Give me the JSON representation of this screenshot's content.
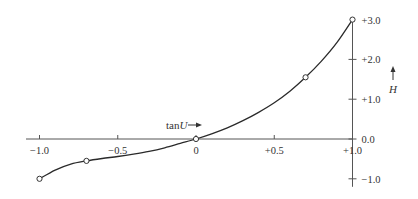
{
  "chart_data": {
    "type": "line",
    "title": "",
    "xlabel": "tanU",
    "ylabel": "H",
    "xlim": [
      -1.0,
      1.0
    ],
    "ylim": [
      -1.0,
      3.0
    ],
    "grid": false,
    "legend": null,
    "x_ticks": [
      -1.0,
      -0.5,
      0,
      0.5,
      1.0
    ],
    "x_tick_labels": [
      "-1.0",
      "-0.5",
      "0",
      "+0.5",
      "+1.0"
    ],
    "y_ticks": [
      -1.0,
      0.0,
      1.0,
      2.0,
      3.0
    ],
    "y_tick_labels": [
      "-1.0",
      "0.0",
      "+1.0",
      "+2.0",
      "+3.0"
    ],
    "series": [
      {
        "name": "H",
        "marker": "open-circle",
        "x": [
          -1.0,
          -0.7,
          0.0,
          0.7,
          1.0
        ],
        "y": [
          -1.0,
          -0.55,
          0.0,
          1.55,
          3.0
        ]
      }
    ],
    "curve_samples": {
      "x": [
        -1.0,
        -0.9,
        -0.8,
        -0.7,
        -0.6,
        -0.5,
        -0.4,
        -0.3,
        -0.2,
        -0.1,
        0.0,
        0.1,
        0.2,
        0.3,
        0.4,
        0.5,
        0.6,
        0.7,
        0.8,
        0.9,
        1.0
      ],
      "y": [
        -1.0,
        -0.78,
        -0.63,
        -0.55,
        -0.49,
        -0.44,
        -0.38,
        -0.31,
        -0.22,
        -0.11,
        0.0,
        0.13,
        0.28,
        0.46,
        0.67,
        0.91,
        1.2,
        1.55,
        1.95,
        2.42,
        3.0
      ]
    },
    "annotations": [
      {
        "text": "tanU",
        "arrow": "right",
        "position": "above x-axis near origin"
      },
      {
        "text": "H",
        "arrow": "up",
        "position": "right of y-axis"
      }
    ]
  }
}
